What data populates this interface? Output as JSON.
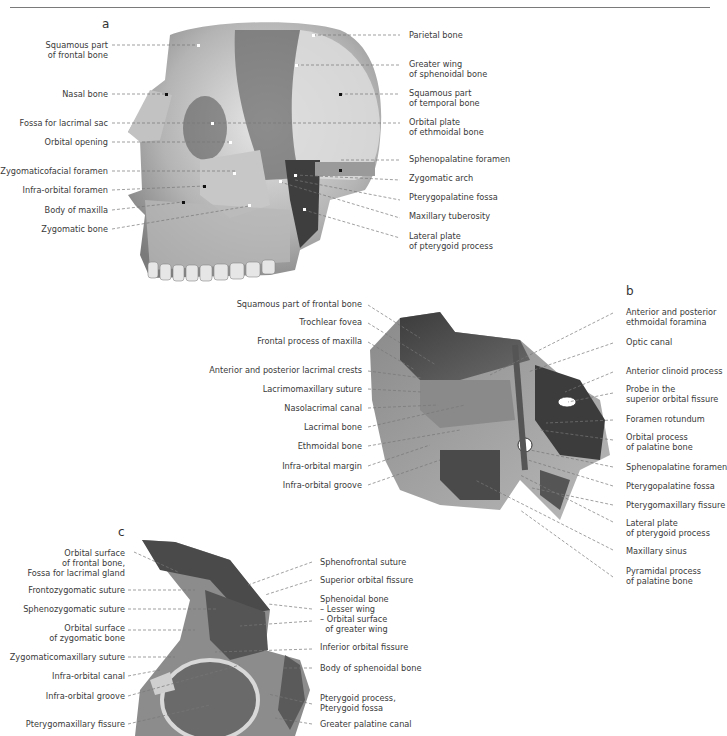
{
  "page": {
    "panels": [
      "a",
      "b",
      "c"
    ]
  },
  "figure_a": {
    "letter": "a",
    "left_labels": [
      {
        "lines": [
          "Squamous part",
          "of frontal bone"
        ]
      },
      {
        "lines": [
          "Nasal bone"
        ]
      },
      {
        "lines": [
          "Fossa for lacrimal sac"
        ]
      },
      {
        "lines": [
          "Orbital opening"
        ]
      },
      {
        "lines": [
          "Zygomaticofacial foramen"
        ]
      },
      {
        "lines": [
          "Infra-orbital foramen"
        ]
      },
      {
        "lines": [
          "Body of maxilla"
        ]
      },
      {
        "lines": [
          "Zygomatic bone"
        ]
      }
    ],
    "right_labels": [
      {
        "lines": [
          "Parietal bone"
        ]
      },
      {
        "lines": [
          "Greater wing",
          "of sphenoidal bone"
        ]
      },
      {
        "lines": [
          "Squamous part",
          "of temporal bone"
        ]
      },
      {
        "lines": [
          "Orbital plate",
          "of ethmoidal bone"
        ]
      },
      {
        "lines": [
          "Sphenopalatine foramen"
        ]
      },
      {
        "lines": [
          "Zygomatic arch"
        ]
      },
      {
        "lines": [
          "Pterygopalatine fossa"
        ]
      },
      {
        "lines": [
          "Maxillary tuberosity"
        ]
      },
      {
        "lines": [
          "Lateral plate",
          "of pterygoid process"
        ]
      }
    ]
  },
  "figure_b": {
    "letter": "b",
    "left_labels": [
      {
        "lines": [
          "Squamous part of frontal bone"
        ]
      },
      {
        "lines": [
          "Trochlear fovea"
        ]
      },
      {
        "lines": [
          "Frontal process of maxilla"
        ]
      },
      {
        "lines": [
          "Anterior and posterior lacrimal crests"
        ]
      },
      {
        "lines": [
          "Lacrimomaxillary suture"
        ]
      },
      {
        "lines": [
          "Nasolacrimal canal"
        ]
      },
      {
        "lines": [
          "Lacrimal bone"
        ]
      },
      {
        "lines": [
          "Ethmoidal bone"
        ]
      },
      {
        "lines": [
          "Infra-orbital margin"
        ]
      },
      {
        "lines": [
          "Infra-orbital groove"
        ]
      }
    ],
    "right_labels": [
      {
        "lines": [
          "Anterior and posterior",
          "ethmoidal foramina"
        ]
      },
      {
        "lines": [
          "Optic canal"
        ]
      },
      {
        "lines": [
          "Anterior clinoid process"
        ]
      },
      {
        "lines": [
          "Probe in the",
          "superior orbital fissure"
        ]
      },
      {
        "lines": [
          "Foramen rotundum"
        ]
      },
      {
        "lines": [
          "Orbital process",
          "of palatine bone"
        ]
      },
      {
        "lines": [
          "Sphenopalatine foramen"
        ]
      },
      {
        "lines": [
          "Pterygopalatine fossa"
        ]
      },
      {
        "lines": [
          "Pterygomaxillary fissure"
        ]
      },
      {
        "lines": [
          "Lateral plate",
          "of pterygoid process"
        ]
      },
      {
        "lines": [
          "Maxillary sinus"
        ]
      },
      {
        "lines": [
          "Pyramidal process",
          "of palatine bone"
        ]
      }
    ]
  },
  "figure_c": {
    "letter": "c",
    "left_labels": [
      {
        "lines": [
          "Orbital surface",
          "of frontal bone,",
          "Fossa for lacrimal gland"
        ]
      },
      {
        "lines": [
          "Frontozygomatic suture"
        ]
      },
      {
        "lines": [
          "Sphenozygomatic suture"
        ]
      },
      {
        "lines": [
          "Orbital surface",
          "of zygomatic bone"
        ]
      },
      {
        "lines": [
          "Zygomaticomaxillary suture"
        ]
      },
      {
        "lines": [
          "Infra-orbital canal"
        ]
      },
      {
        "lines": [
          "Infra-orbital groove"
        ]
      },
      {
        "lines": [
          "Pterygomaxillary fissure"
        ]
      }
    ],
    "right_labels": [
      {
        "lines": [
          "Sphenofrontal suture"
        ]
      },
      {
        "lines": [
          "Superior orbital fissure"
        ]
      },
      {
        "lines": [
          "Sphenoidal bone",
          "– Lesser wing",
          "– Orbital surface",
          "  of greater wing"
        ]
      },
      {
        "lines": [
          "Inferior orbital fissure"
        ]
      },
      {
        "lines": [
          "Body of sphenoidal bone"
        ]
      },
      {
        "lines": [
          "Pterygoid process,",
          "Pterygoid fossa"
        ]
      },
      {
        "lines": [
          "Greater palatine canal"
        ]
      }
    ]
  }
}
